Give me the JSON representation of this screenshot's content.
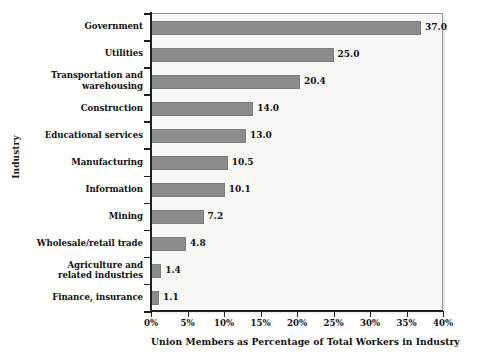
{
  "chart_data": {
    "type": "bar",
    "orientation": "horizontal",
    "title": "",
    "xlabel": "Union Members as Percentage of Total Workers in Industry",
    "ylabel": "Industry",
    "xlim": [
      0,
      40
    ],
    "xticks": [
      0,
      5,
      10,
      15,
      20,
      25,
      30,
      35,
      40
    ],
    "xticklabels": [
      "0%",
      "5%",
      "10%",
      "15%",
      "20%",
      "25%",
      "30%",
      "35%",
      "40%"
    ],
    "grid": false,
    "legend": false,
    "bar_color": "#8b8b8b",
    "plot_background": "#f7f7f6",
    "categories": [
      "Government",
      "Utilities",
      "Transportation and\nwarehousing",
      "Construction",
      "Educational services",
      "Manufacturing",
      "Information",
      "Mining",
      "Wholesale/retail trade",
      "Agriculture and\nrelated industries",
      "Finance, insurance"
    ],
    "values": [
      37.0,
      25.0,
      20.4,
      14.0,
      13.0,
      10.5,
      10.1,
      7.2,
      4.8,
      1.4,
      1.1
    ],
    "data_labels": [
      "37.0",
      "25.0",
      "20.4",
      "14.0",
      "13.0",
      "10.5",
      "10.1",
      "7.2",
      "4.8",
      "1.4",
      "1.1"
    ]
  }
}
